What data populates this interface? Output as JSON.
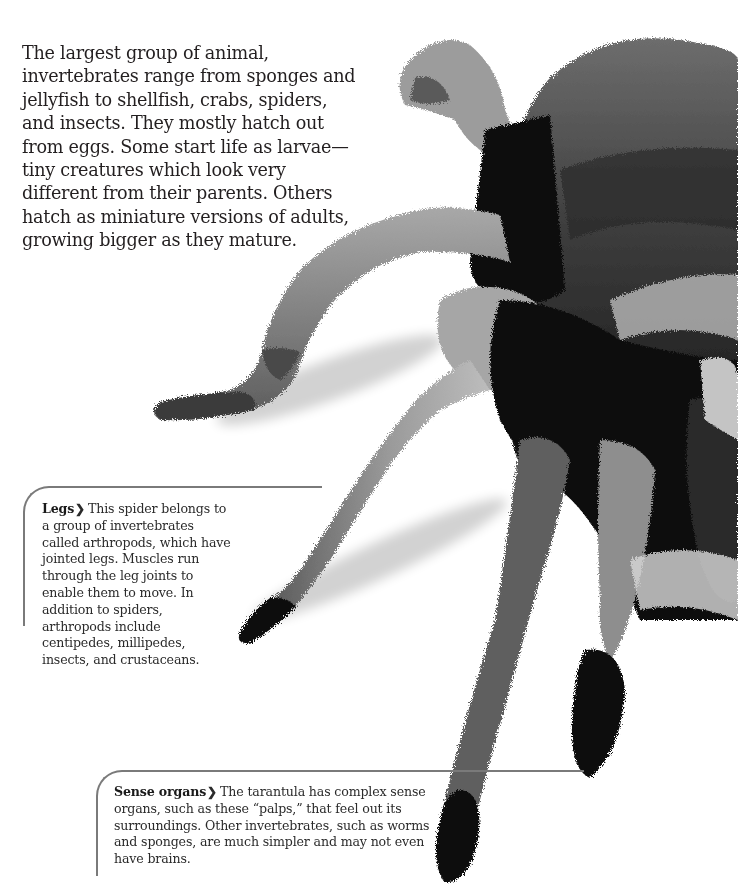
{
  "intro": {
    "text": "The largest group of animal, invertebrates range from sponges and jellyfish to shellfish, crabs, spiders, and insects. They mostly hatch out from eggs. Some start life as larvae—tiny creatures which look very different from their parents. Others hatch as miniature versions of adults, growing bigger as they mature."
  },
  "callouts": [
    {
      "heading": "Legs",
      "chevron": "❯",
      "body": "This spider belongs to a group of invertebrates called arthropods, which have jointed legs. Muscles run through the leg joints to enable them to move. In addition to spiders, arthropods include centipedes, millipedes, insects, and crustaceans."
    },
    {
      "heading": "Sense organs",
      "chevron": "❯",
      "body": "The tarantula has complex sense organs, such as these “palps,” that feel out its surroundings. Other invertebrates, such as worms and sponges, are much simpler and may not even have brains."
    }
  ],
  "image": {
    "subject": "tarantula-photo",
    "colors": {
      "background": "#ffffff",
      "fur_dark": "#111111",
      "fur_mid": "#5a5a5a",
      "fur_light": "#b8b8b8",
      "rule": "#7a7a7a"
    }
  }
}
